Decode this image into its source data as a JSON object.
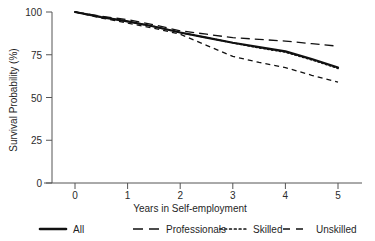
{
  "chart_data": {
    "type": "line",
    "title": "",
    "xlabel": "Years in Self-employment",
    "ylabel": "Survival Probability (%)",
    "xlim": [
      0,
      5
    ],
    "ylim": [
      0,
      100
    ],
    "xticks": [
      "0",
      "1",
      "2",
      "3",
      "4",
      "5"
    ],
    "yticks": [
      "0",
      "25",
      "50",
      "75",
      "100"
    ],
    "grid": false,
    "legend_position": "bottom",
    "x": [
      0,
      0.5,
      1,
      1.5,
      2,
      2.5,
      3,
      3.5,
      4,
      4.5,
      5
    ],
    "series": [
      {
        "name": "All",
        "style": "solid",
        "color": "#111111",
        "values": [
          100,
          97,
          94.5,
          91.5,
          88,
          85,
          82,
          79.5,
          77,
          72.5,
          67.5
        ]
      },
      {
        "name": "Professionals",
        "style": "long-dash",
        "color": "#111111",
        "values": [
          100,
          97.5,
          95.5,
          92.5,
          89,
          87,
          85,
          84,
          83,
          81.5,
          80
        ]
      },
      {
        "name": "Skilled",
        "style": "dotted",
        "color": "#111111",
        "values": [
          100,
          97,
          94.5,
          91.5,
          88,
          85,
          82,
          79,
          76.5,
          72,
          67
        ]
      },
      {
        "name": "Unskilled",
        "style": "dash",
        "color": "#111111",
        "values": [
          100,
          96.5,
          93.5,
          90.5,
          87,
          80.5,
          74,
          70.5,
          67.5,
          63,
          59
        ]
      }
    ]
  },
  "legend": {
    "items": [
      {
        "label": "All",
        "style": "solid"
      },
      {
        "label": "Professionals",
        "style": "long-dash"
      },
      {
        "label": "Skilled",
        "style": "dotted"
      },
      {
        "label": "Unskilled",
        "style": "dash"
      }
    ]
  }
}
